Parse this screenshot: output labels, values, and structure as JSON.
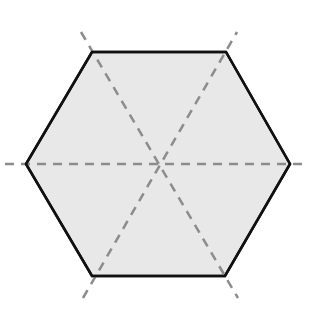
{
  "diagram": {
    "title": "",
    "shape": "regular-hexagon",
    "colors": {
      "background": "#ffffff",
      "fill": "#e8e8e8",
      "outline": "#111111",
      "symmetry_lines": "#8c8c8c"
    },
    "hexagon": {
      "center": [
        158,
        164
      ],
      "vertices": [
        [
          92,
          52
        ],
        [
          226,
          52
        ],
        [
          290,
          164
        ],
        [
          225,
          276
        ],
        [
          92,
          276
        ],
        [
          26,
          164
        ]
      ]
    },
    "symmetry_lines": [
      {
        "id": "horizontal",
        "from": [
          5,
          164
        ],
        "to": [
          302,
          164
        ]
      },
      {
        "id": "diagonal-rising",
        "from": [
          83,
          298
        ],
        "to": [
          237,
          32
        ]
      },
      {
        "id": "diagonal-falling",
        "from": [
          81,
          32
        ],
        "to": [
          238,
          298
        ]
      }
    ],
    "symmetry_count": 6
  }
}
